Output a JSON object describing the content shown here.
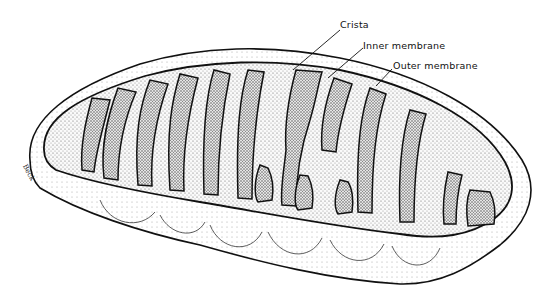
{
  "figure": {
    "colors": {
      "ink": "#111111",
      "background": "#ffffff",
      "stipple_dark": "#555555",
      "stipple_light": "#bbbbbb"
    },
    "labels": [
      {
        "text": "Crista",
        "x": 340,
        "y": 19,
        "line": [
          340,
          30,
          293,
          70
        ]
      },
      {
        "text": "Inner membrane",
        "x": 363,
        "y": 40,
        "line": [
          363,
          48,
          328,
          78
        ]
      },
      {
        "text": "Outer membrane",
        "x": 393,
        "y": 60,
        "line": [
          392,
          69,
          376,
          86
        ]
      }
    ],
    "signature": "Beck"
  }
}
